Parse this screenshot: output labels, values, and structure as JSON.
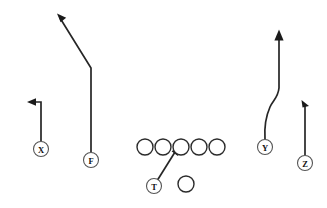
{
  "diagram": {
    "type": "football-play-diagram",
    "title": "",
    "background_color": "#ffffff",
    "line_color": "#1a1a1a",
    "width": 327,
    "height": 208,
    "offensive_line": {
      "label": "offensive-line",
      "count": 5,
      "circle_radius": 8.0,
      "center_y": 147,
      "centers_x": [
        145,
        163,
        181,
        199,
        217
      ]
    },
    "quarterback": {
      "label": "quarterback",
      "cx": 186,
      "cy": 184,
      "r": 8.0
    },
    "players": [
      {
        "id": "X",
        "label": "X",
        "name": "receiver-x",
        "cx": 41,
        "cy": 149,
        "r": 7.5,
        "route": "out",
        "route_description": "vertical stem then break to sideline (out)"
      },
      {
        "id": "F",
        "label": "F",
        "name": "receiver-f",
        "cx": 91,
        "cy": 160,
        "r": 7.5,
        "route": "post-corner",
        "route_description": "long vertical stem then diagonal break upfield left"
      },
      {
        "id": "T",
        "label": "T",
        "name": "running-back-t",
        "cx": 154,
        "cy": 186,
        "r": 7.5,
        "route": "block",
        "route_description": "angle path up to the line of scrimmage"
      },
      {
        "id": "Y",
        "label": "Y",
        "name": "receiver-y",
        "cx": 265,
        "cy": 147,
        "r": 7.5,
        "route": "seam",
        "route_description": "curving vertical seam route upfield"
      },
      {
        "id": "Z",
        "label": "Z",
        "name": "receiver-z",
        "cx": 305,
        "cy": 163,
        "r": 7.5,
        "route": "short-vertical",
        "route_description": "short vertical stem with angled arrow"
      }
    ],
    "routes": [
      {
        "name": "route-x",
        "player": "X",
        "path": "M 41 141 L 41 102 L 31 102",
        "arrow": "M 27 102 L 36 98.3 L 36 105.7 Z"
      },
      {
        "name": "route-f",
        "player": "F",
        "path": "M 91 152 L 91 68 L 60 18",
        "arrow": "M 57 13.5 L 66.2 17.7 L 60.6 22.3 Z"
      },
      {
        "name": "route-t",
        "player": "T",
        "path": "M 157.5 180 L 176 150.5",
        "arrow": "M 178.4 146.8 L 177.8 156 L 171.6 151.3 Z"
      },
      {
        "name": "route-y",
        "player": "Y",
        "path": "M 265 139 C 264 124 266 116 270 107 C 273 100 278 98 279 88 L 279 36",
        "arrow": "M 279 29.5 L 283.6 40.5 L 274.4 40.5 Z"
      },
      {
        "name": "route-z",
        "player": "Z",
        "path": "M 305 155 L 305 105",
        "arrow": "M 301.5 100 L 309 106 L 302.5 107.5 Z"
      }
    ]
  }
}
